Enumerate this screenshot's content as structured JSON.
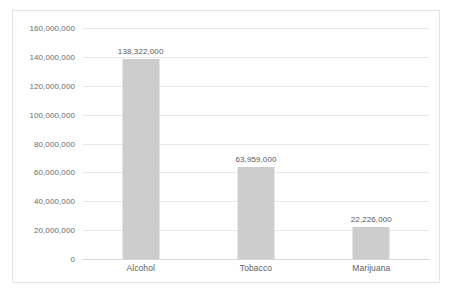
{
  "chart_data": {
    "type": "bar",
    "title": "",
    "subtitle": "",
    "xlabel": "",
    "ylabel": "",
    "categories": [
      "Alcohol",
      "Tobacco",
      "Marijuana"
    ],
    "values": [
      138322000,
      63959000,
      22226000
    ],
    "value_labels": [
      "138,322,000",
      "63,959,000",
      "22,226,000"
    ],
    "ylim": [
      0,
      160000000
    ],
    "ytick_values": [
      0,
      20000000,
      40000000,
      60000000,
      80000000,
      100000000,
      120000000,
      140000000,
      160000000
    ],
    "ytick_labels": [
      "0",
      "20,000,000",
      "40,000,000",
      "60,000,000",
      "80,000,000",
      "100,000,000",
      "120,000,000",
      "140,000,000",
      "160,000,000"
    ],
    "grid": true,
    "legend": false,
    "legend_position": "none",
    "bar_color": "#cdcdcd",
    "gridline_color": "#e8e8e8",
    "axis_color": "#d6d6d6",
    "label_color": "#595959",
    "tick_label_color": "#6b6b6b",
    "border_color": "#e3e3e3",
    "background_color": "#ffffff"
  }
}
